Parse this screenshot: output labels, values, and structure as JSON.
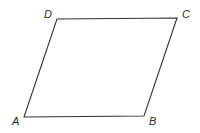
{
  "figure": {
    "shape": "parallelogram",
    "stroke_color": "#333333",
    "vertices": [
      {
        "label": "A",
        "x": 24,
        "y": 117,
        "label_x": 12,
        "label_y": 125
      },
      {
        "label": "B",
        "x": 144,
        "y": 116,
        "label_x": 149,
        "label_y": 125
      },
      {
        "label": "C",
        "x": 177,
        "y": 18,
        "label_x": 182,
        "label_y": 18
      },
      {
        "label": "D",
        "x": 57,
        "y": 19,
        "label_x": 44,
        "label_y": 18
      }
    ]
  }
}
